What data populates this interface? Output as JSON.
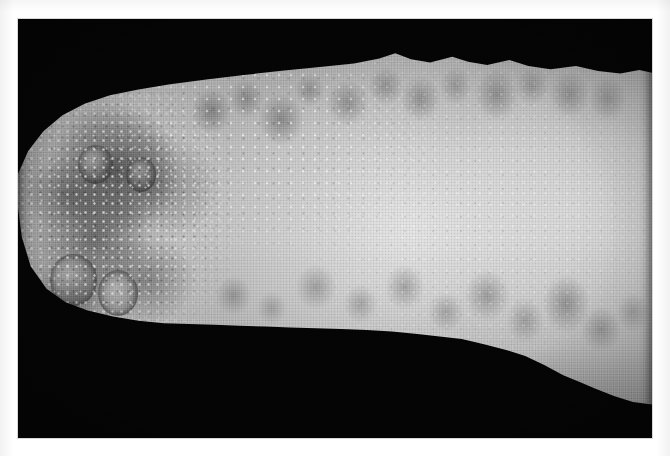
{
  "page": {
    "background_color": "#ffffff",
    "type": "clinical-photograph-plate",
    "caption": "",
    "label": ""
  },
  "plate": {
    "name": "clinical-photograph",
    "background_color": "#050505",
    "color_mode": "grayscale",
    "left": 18,
    "top": 19,
    "width": 634,
    "height": 419,
    "alt_text": "Grayscale clinical photograph of a limb shown against a black background, with numerous clustered vesicular and papular skin lesions concentrated toward the proximal end."
  },
  "subject": {
    "name": "limb",
    "description": "Distal limb segment, rounded proximal end at left tapering toward the right",
    "skin_base_color": "#b9b9b9",
    "skin_highlight_color": "#e8e8e8",
    "skin_shadow_color": "#6e6e6e",
    "lesion_color": "#343434"
  },
  "findings": [
    {
      "id": "plaque-proximal",
      "label": "Confluent dark plaque, proximal third",
      "region": "proximal",
      "severity": "dense"
    },
    {
      "id": "macules-dorsal",
      "label": "Scattered macules along dorsal margin",
      "region": "dorsal",
      "severity": "scattered"
    },
    {
      "id": "macules-ventral",
      "label": "Scattered macules along ventral margin",
      "region": "ventral",
      "severity": "scattered"
    },
    {
      "id": "annular-lesions",
      "label": "Annular crusted lesions",
      "region": "proximal",
      "severity": "discrete",
      "count": 4
    },
    {
      "id": "vesicles",
      "label": "Clustered pinpoint vesicles with bright highlights",
      "region": "proximal-to-mid",
      "severity": "numerous"
    }
  ],
  "texture": {
    "halftone": "visible printed halftone dot pattern from scanned page",
    "grain": "fine scan grain"
  }
}
